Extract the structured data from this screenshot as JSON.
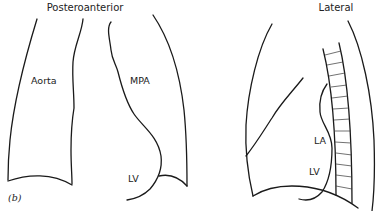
{
  "figure": {
    "panel_label": "(b)",
    "views": [
      {
        "id": "pa",
        "title": "Posteroanterior",
        "labels": [
          "Aorta",
          "MPA",
          "LV"
        ]
      },
      {
        "id": "lateral",
        "title": "Lateral",
        "labels": [
          "LA",
          "LV"
        ]
      }
    ]
  },
  "colors": {
    "line": "#1a1a1a",
    "background": "#ffffff"
  }
}
